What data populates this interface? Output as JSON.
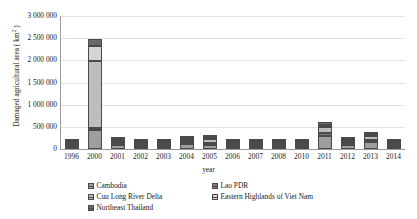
{
  "chart_data": {
    "type": "bar",
    "stacked": true,
    "title": "",
    "xlabel": "year",
    "ylabel": "Damaged agricultural area ( km2 )",
    "ylabel_base": "Damaged agricultural area ( km",
    "ylabel_sup": "2",
    "ylabel_tail": " )",
    "ylim": [
      0,
      3000000
    ],
    "ytick_step": 500000,
    "ytick_labels": [
      "3 000 000",
      "2 500 000",
      "2 000 000",
      "1 500 000",
      "1 000 000",
      "500 000",
      "0"
    ],
    "ytick_values": [
      3000000,
      2500000,
      2000000,
      1500000,
      1000000,
      500000,
      0
    ],
    "grid": true,
    "legend_position": "bottom",
    "categories": [
      "1996",
      "2000",
      "2001",
      "2002",
      "2003",
      "2004",
      "2005",
      "2006",
      "2007",
      "2008",
      "2010",
      "2011",
      "2012",
      "2013",
      "2014"
    ],
    "series": [
      {
        "name": "Cambodia",
        "values": [
          40000,
          430000,
          95000,
          30000,
          8000,
          120000,
          90000,
          22000,
          40000,
          50000,
          22000,
          300000,
          80000,
          150000,
          18000
        ]
      },
      {
        "name": "Lao PDR",
        "values": [
          12000,
          30000,
          25000,
          10000,
          3000,
          30000,
          25000,
          8000,
          15000,
          12000,
          8000,
          60000,
          20000,
          55000,
          6000
        ]
      },
      {
        "name": "Cuu Long River Delta",
        "values": [
          15000,
          1500000,
          40000,
          12000,
          4000,
          45000,
          80000,
          10000,
          18000,
          16000,
          10000,
          130000,
          35000,
          80000,
          8000
        ]
      },
      {
        "name": "Eastern Highlands of Viet Nam",
        "values": [
          8000,
          350000,
          20000,
          6000,
          2000,
          25000,
          30000,
          6000,
          10000,
          9000,
          5000,
          60000,
          20000,
          45000,
          4000
        ]
      },
      {
        "name": "Northeast Thailand",
        "values": [
          10000,
          160000,
          20000,
          8000,
          3000,
          30000,
          25000,
          7000,
          12000,
          10000,
          6000,
          50000,
          15000,
          40000,
          5000
        ]
      }
    ],
    "series_colors": [
      "#9e9e9e",
      "#7d7d7d",
      "#bdbdbd",
      "#d6d6d6",
      "#6a6a6a"
    ],
    "totals": [
      85000,
      2470000,
      200000,
      66000,
      20000,
      250000,
      250000,
      53000,
      95000,
      97000,
      51000,
      600000,
      170000,
      370000,
      41000
    ]
  },
  "legend": {
    "column_left": [
      {
        "label": "Cambodia",
        "key": "cambodia"
      },
      {
        "label": "Cuu Long River Delta",
        "key": "cuulong"
      },
      {
        "label": "Northeast Thailand",
        "key": "netthai"
      }
    ],
    "column_right": [
      {
        "label": "Lao PDR",
        "key": "laopdr"
      },
      {
        "label": "Eastern Highlands of Viet Nam",
        "key": "eastern"
      }
    ]
  }
}
